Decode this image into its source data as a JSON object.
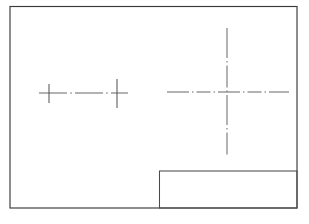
{
  "sheet": {
    "title": "Engineering Drawing Sheet",
    "background_color": "#ffffff",
    "width": 309,
    "height": 224,
    "description": "Blank technical drawing sheet with border frame, empty title block, and construction centerlines"
  },
  "border": {
    "name": "drawing-border-frame",
    "color": "#3a3a3c",
    "x": 10,
    "y": 6.5,
    "width": 287,
    "height": 201.5,
    "stroke_width": 1.15
  },
  "title_block": {
    "name": "title-block",
    "color": "#4a4a4d",
    "x": 159.5,
    "y": 171,
    "width": 137.5,
    "height": 37,
    "stroke_width": 1.05,
    "text": ""
  },
  "centerlines": {
    "color": "#5e5e62",
    "left_group": {
      "label": "small-centerline-group",
      "horizontal": {
        "x1": 39,
        "x2": 128,
        "y": 93,
        "style": "dash-dot"
      },
      "ticks": [
        {
          "x": 49,
          "y1": 84,
          "y2": 103
        },
        {
          "x": 117,
          "y1": 79,
          "y2": 108
        }
      ]
    },
    "right_group": {
      "label": "large-crosshair",
      "center_x": 227,
      "center_y": 92,
      "horizontal": {
        "x1": 167,
        "x2": 289,
        "y": 92,
        "style": "dash-dot"
      },
      "vertical": {
        "x": 227,
        "y1": 28,
        "y2": 157,
        "style": "dash-dot"
      }
    }
  }
}
